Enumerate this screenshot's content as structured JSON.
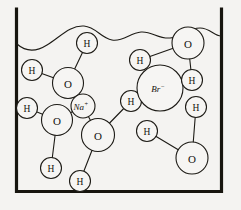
{
  "diagram": {
    "container": {
      "name": "beaker",
      "wall_color": "#17150f",
      "interior_color": "#f4f3f1"
    },
    "water_surface": {
      "name": "water-surface-line",
      "color": "#1d1b16"
    },
    "labels": {
      "oxygen": "O",
      "hydrogen": "H",
      "sodium_ion_symbol": "Na",
      "sodium_ion_charge": "+",
      "bromide_ion_symbol": "Br",
      "bromide_ion_charge": "−"
    },
    "atoms": [
      {
        "id": "h-top-center",
        "label": "H",
        "kind": "hydrogen",
        "cx": 87,
        "cy": 43,
        "r": 10.5
      },
      {
        "id": "o-upper-left",
        "label": "O",
        "kind": "oxygen",
        "cx": 68,
        "cy": 83,
        "r": 15.5
      },
      {
        "id": "h-left-upper",
        "label": "H",
        "kind": "hydrogen",
        "cx": 32,
        "cy": 70,
        "r": 10.5
      },
      {
        "id": "na-ion",
        "label": "Na",
        "kind": "cation",
        "cx": 83,
        "cy": 106,
        "r": 12.0
      },
      {
        "id": "h-left-lower",
        "label": "H",
        "kind": "hydrogen",
        "cx": 27,
        "cy": 108,
        "r": 10.5
      },
      {
        "id": "o-lower-left",
        "label": "O",
        "kind": "oxygen",
        "cx": 57,
        "cy": 120,
        "r": 15.5
      },
      {
        "id": "h-bottom-left",
        "label": "H",
        "kind": "hydrogen",
        "cx": 51,
        "cy": 168,
        "r": 10.5
      },
      {
        "id": "o-center",
        "label": "O",
        "kind": "oxygen",
        "cx": 98,
        "cy": 135,
        "r": 16.5
      },
      {
        "id": "h-bottom-mid",
        "label": "H",
        "kind": "hydrogen",
        "cx": 80,
        "cy": 181,
        "r": 10.5
      },
      {
        "id": "h-center",
        "label": "H",
        "kind": "hydrogen",
        "cx": 131,
        "cy": 101,
        "r": 10.5
      },
      {
        "id": "br-ion",
        "label": "Br",
        "kind": "anion",
        "cx": 160,
        "cy": 88,
        "r": 23.0
      },
      {
        "id": "h-upper-mid",
        "label": "H",
        "kind": "hydrogen",
        "cx": 140,
        "cy": 60,
        "r": 10.5
      },
      {
        "id": "o-top-right",
        "label": "O",
        "kind": "oxygen",
        "cx": 188,
        "cy": 43,
        "r": 16.0
      },
      {
        "id": "h-right-upper",
        "label": "H",
        "kind": "hydrogen",
        "cx": 192,
        "cy": 80,
        "r": 10.5
      },
      {
        "id": "h-right-mid",
        "label": "H",
        "kind": "hydrogen",
        "cx": 196,
        "cy": 107,
        "r": 10.5
      },
      {
        "id": "h-lower-mid",
        "label": "H",
        "kind": "hydrogen",
        "cx": 147,
        "cy": 131,
        "r": 10.5
      },
      {
        "id": "o-bottom-right",
        "label": "O",
        "kind": "oxygen",
        "cx": 192,
        "cy": 158,
        "r": 16.0
      }
    ],
    "bonds": [
      {
        "from": "h-top-center",
        "to": "o-upper-left"
      },
      {
        "from": "h-left-upper",
        "to": "o-upper-left"
      },
      {
        "from": "o-upper-left",
        "to": "na-ion"
      },
      {
        "from": "h-left-lower",
        "to": "o-lower-left"
      },
      {
        "from": "o-lower-left",
        "to": "h-bottom-left"
      },
      {
        "from": "o-lower-left",
        "to": "na-ion"
      },
      {
        "from": "o-center",
        "to": "na-ion"
      },
      {
        "from": "o-center",
        "to": "h-bottom-mid"
      },
      {
        "from": "o-center",
        "to": "h-center"
      },
      {
        "from": "h-upper-mid",
        "to": "o-top-right"
      },
      {
        "from": "o-top-right",
        "to": "h-right-upper"
      },
      {
        "from": "h-right-mid",
        "to": "o-bottom-right"
      },
      {
        "from": "h-lower-mid",
        "to": "o-bottom-right"
      }
    ]
  }
}
